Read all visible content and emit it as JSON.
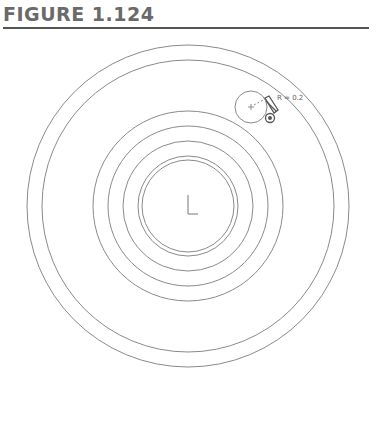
{
  "figure": {
    "title": "FIGURE 1.124"
  },
  "drawing": {
    "radius_label": "R = 0.2",
    "line_color": "#8a8a8a",
    "center": {
      "x": 188,
      "y": 206
    },
    "rings": [
      162,
      146,
      95,
      80,
      65,
      51,
      47
    ],
    "small_circle": {
      "cx": 251,
      "cy": 107,
      "r": 16
    }
  }
}
